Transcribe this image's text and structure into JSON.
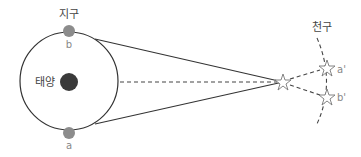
{
  "diagram": {
    "labels": {
      "earth": "지구",
      "sun": "태양",
      "celestial_sphere": "천구",
      "position_a": "a",
      "position_b": "b",
      "image_a": "a'",
      "image_b": "b'"
    },
    "colors": {
      "orbit_line": "#333333",
      "sun": "#3a3a3a",
      "earth": "#8c8c8c",
      "star_stroke": "#777777",
      "dashed_line": "#444444",
      "label_text": "#444444",
      "sub_label_text": "#888888"
    },
    "elements": {
      "orbit": {
        "cx": 69,
        "cy": 81,
        "r": 49
      },
      "sun": {
        "cx": 69,
        "cy": 82,
        "r": 9
      },
      "earth_b": {
        "cx": 69,
        "cy": 31,
        "r": 6
      },
      "earth_a": {
        "cx": 69,
        "cy": 133,
        "r": 6
      },
      "near_star": {
        "cx": 283,
        "cy": 82
      },
      "star_a_prime": {
        "cx": 327,
        "cy": 68
      },
      "star_b_prime": {
        "cx": 327,
        "cy": 97
      }
    }
  }
}
